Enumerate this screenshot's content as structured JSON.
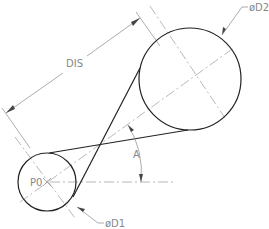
{
  "drawing": {
    "labels": {
      "distance": "DIS",
      "diameter_large": "øD2",
      "diameter_small": "øD1",
      "origin_point": "P0",
      "angle": "A"
    },
    "colors": {
      "outline": "#222222",
      "centerline": "#999999",
      "dimension": "#888888",
      "background": "#ffffff"
    }
  }
}
